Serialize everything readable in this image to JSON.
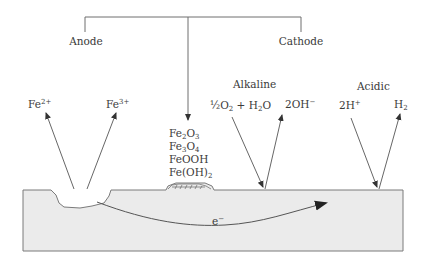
{
  "diagram": {
    "type": "corrosion-cell-schematic",
    "bracket": {
      "left_label": "Anode",
      "right_label": "Cathode"
    },
    "anode_products": [
      {
        "base": "Fe",
        "sup": "2+"
      },
      {
        "base": "Fe",
        "sup": "3+"
      }
    ],
    "corrosion_products": [
      {
        "parts": [
          "Fe",
          "2",
          "O",
          "3"
        ]
      },
      {
        "parts": [
          "Fe",
          "3",
          "O",
          "4"
        ]
      },
      {
        "text": "FeOOH"
      },
      {
        "text": "Fe(OH)",
        "sub": "2"
      }
    ],
    "cathode_alkaline": {
      "title": "Alkaline",
      "reactant": "½O₂ + H₂O",
      "reactant_parts": [
        "½O",
        "2",
        " + H",
        "2",
        "O"
      ],
      "product": {
        "base": "2OH",
        "sup": "−"
      }
    },
    "cathode_acidic": {
      "title": "Acidic",
      "reactant": {
        "base": "2H",
        "sup": "+"
      },
      "product": {
        "base": "H",
        "sub": "2"
      }
    },
    "electron_flow": {
      "base": "e",
      "sup": "−"
    },
    "colors": {
      "line": "#6e6e6e",
      "metal_fill": "#ebebeb",
      "metal_stroke": "#7a7a7a",
      "text": "#3a3a3a"
    }
  }
}
